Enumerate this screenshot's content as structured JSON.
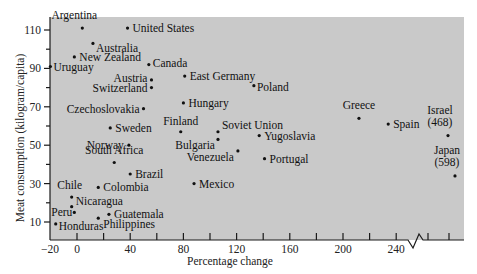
{
  "chart_data": {
    "type": "scatter",
    "title": "",
    "xlabel": "Percentage change",
    "ylabel": "Meat consumption (kilogram/capita)",
    "xlim": [
      -20,
      270
    ],
    "ylim": [
      2,
      115
    ],
    "x_ticks": [
      -20,
      0,
      40,
      80,
      120,
      160,
      200,
      240
    ],
    "x_minor_ticks": [
      20,
      60,
      100,
      140,
      180,
      220
    ],
    "x_break_after": 240,
    "x_ticks_after_break": [
      250,
      265
    ],
    "y_ticks": [
      10,
      30,
      50,
      70,
      90,
      110
    ],
    "y_minor_ticks": [
      20,
      40,
      60,
      80,
      100
    ],
    "grid": false,
    "legend": "none",
    "points": [
      {
        "name": "Argentina",
        "x": 4,
        "y": 111
      },
      {
        "name": "United States",
        "x": 38,
        "y": 111
      },
      {
        "name": "Australia",
        "x": 12,
        "y": 103
      },
      {
        "name": "New Zealand",
        "x": -2,
        "y": 96
      },
      {
        "name": "Uruguay",
        "x": -20,
        "y": 91
      },
      {
        "name": "Canada",
        "x": 54,
        "y": 92
      },
      {
        "name": "East Germany",
        "x": 81,
        "y": 86
      },
      {
        "name": "Austria",
        "x": 56,
        "y": 84
      },
      {
        "name": "Switzerland",
        "x": 56,
        "y": 80
      },
      {
        "name": "Poland",
        "x": 133,
        "y": 81
      },
      {
        "name": "Hungary",
        "x": 80,
        "y": 72
      },
      {
        "name": "Czechoslovakia",
        "x": 50,
        "y": 69
      },
      {
        "name": "Sweden",
        "x": 25,
        "y": 59
      },
      {
        "name": "Finland",
        "x": 78,
        "y": 57
      },
      {
        "name": "Soviet Union",
        "x": 106,
        "y": 57
      },
      {
        "name": "Bulgaria",
        "x": 106,
        "y": 53
      },
      {
        "name": "Yugoslavia",
        "x": 137,
        "y": 55
      },
      {
        "name": "Norway",
        "x": 39,
        "y": 50
      },
      {
        "name": "Venezuela",
        "x": 121,
        "y": 47
      },
      {
        "name": "Portugal",
        "x": 141,
        "y": 43
      },
      {
        "name": "South Africa",
        "x": 28,
        "y": 41
      },
      {
        "name": "Brazil",
        "x": 40,
        "y": 35
      },
      {
        "name": "Colombia",
        "x": 16,
        "y": 28
      },
      {
        "name": "Mexico",
        "x": 88,
        "y": 30
      },
      {
        "name": "Chile",
        "x": -4,
        "y": 23
      },
      {
        "name": "Nicaragua",
        "x": -4,
        "y": 18
      },
      {
        "name": "Peru",
        "x": -2,
        "y": 15
      },
      {
        "name": "Guatemala",
        "x": 24,
        "y": 14
      },
      {
        "name": "Philippines",
        "x": 16,
        "y": 12
      },
      {
        "name": "Honduras",
        "x": -16,
        "y": 9
      },
      {
        "name": "Greece",
        "x": 212,
        "y": 64
      },
      {
        "name": "Spain",
        "x": 234,
        "y": 61
      },
      {
        "name": "Israel (468)",
        "x": 468,
        "y": 55
      },
      {
        "name": "Japan (598)",
        "x": 598,
        "y": 34
      }
    ]
  },
  "labels": {
    "x_ticks": [
      "−20",
      "0",
      "40",
      "80",
      "120",
      "160",
      "200",
      "240"
    ],
    "y_ticks": [
      "10",
      "30",
      "50",
      "70",
      "90",
      "110"
    ],
    "xlabel": "Percentage change",
    "ylabel": "Meat consumption (kilogram/capita)"
  }
}
